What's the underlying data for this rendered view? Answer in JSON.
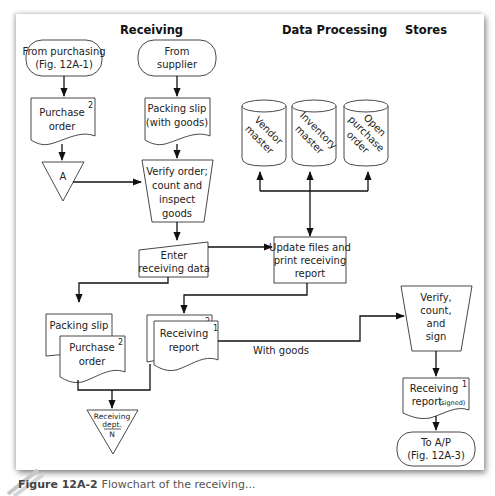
{
  "columns": {
    "receiving": "Receiving",
    "data_processing": "Data Processing",
    "stores": "Stores"
  },
  "terminals": {
    "from_purchasing": [
      "From purchasing",
      "(Fig. 12A-1)"
    ],
    "from_supplier": [
      "From",
      "supplier"
    ],
    "to_ap": [
      "To A/P",
      "(Fig. 12A-3)"
    ]
  },
  "documents": {
    "purchase_order_top": {
      "lines": [
        "Purchase",
        "order"
      ],
      "copy": "2"
    },
    "packing_slip_top": {
      "lines": [
        "Packing slip",
        "(with goods)"
      ]
    },
    "packing_slip_bottom": {
      "lines": [
        "Packing slip"
      ]
    },
    "purchase_order_bottom": {
      "lines": [
        "Purchase",
        "order"
      ],
      "copy": "2"
    },
    "receiving_report": {
      "lines": [
        "Receiving",
        "report"
      ],
      "copy_front": "1",
      "copy_back": "2"
    },
    "receiving_report_signed": {
      "lines": [
        "Receiving",
        "report"
      ],
      "note": "(signed)",
      "copy": "1"
    }
  },
  "connector_a": "A",
  "manual_ops": {
    "verify_order": [
      "Verify order;",
      "count and",
      "inspect",
      "goods"
    ],
    "verify_count_sign": [
      "Verify,",
      "count,",
      "and",
      "sign"
    ]
  },
  "manual_input": {
    "enter_receiving_data": [
      "Enter",
      "receiving data"
    ]
  },
  "process": {
    "update_files": [
      "Update files and",
      "print receiving",
      "report"
    ]
  },
  "files": [
    {
      "id": "vendor",
      "lines": [
        "Vendor",
        "master"
      ]
    },
    {
      "id": "inventory",
      "lines": [
        "Inventory",
        "master"
      ]
    },
    {
      "id": "open_po",
      "lines": [
        "Open",
        "purchase",
        "order"
      ]
    }
  ],
  "offline_file": {
    "lines": [
      "Receiving",
      "dept."
    ],
    "code": "N"
  },
  "flow_labels": {
    "with_goods": "With goods"
  },
  "caption": {
    "figure": "Figure 12A-2",
    "title": "Flowchart of the receiving..."
  }
}
